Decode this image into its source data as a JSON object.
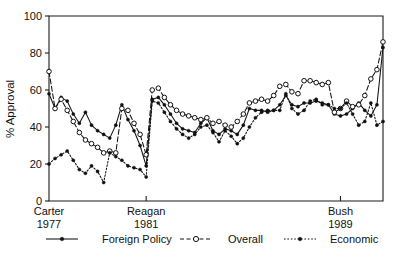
{
  "chart_data": {
    "type": "line",
    "title": "",
    "xlabel": "",
    "ylabel": "% Approval",
    "ylim": [
      0,
      100
    ],
    "yticks": [
      0,
      20,
      40,
      60,
      80,
      100
    ],
    "grid": false,
    "legend_position": "below",
    "xaxis_era_ticks": [
      {
        "label": "Carter",
        "year": "1977",
        "x_index": 0
      },
      {
        "label": "Reagan",
        "year": "1981",
        "x_index": 16
      },
      {
        "label": "Bush",
        "year": "1989",
        "x_index": 48
      }
    ],
    "x": [
      0,
      1,
      2,
      3,
      4,
      5,
      6,
      7,
      8,
      9,
      10,
      11,
      12,
      13,
      14,
      15,
      16,
      17,
      18,
      19,
      20,
      21,
      22,
      23,
      24,
      25,
      26,
      27,
      28,
      29,
      30,
      31,
      32,
      33,
      34,
      35,
      36,
      37,
      38,
      39,
      40,
      41,
      42,
      43,
      44,
      45,
      46,
      47,
      48,
      49,
      50,
      51,
      52,
      53,
      54,
      55
    ],
    "series": [
      {
        "name": "Foreign Policy",
        "marker": "filled-circle",
        "line": "solid",
        "values": [
          58,
          50,
          56,
          54,
          47,
          42,
          48,
          41,
          38,
          36,
          34,
          41,
          52,
          44,
          38,
          30,
          19,
          55,
          56,
          52,
          47,
          42,
          39,
          38,
          37,
          42,
          45,
          38,
          36,
          39,
          38,
          36,
          41,
          50,
          49,
          49,
          48,
          49,
          52,
          57,
          52,
          51,
          53,
          53,
          54,
          53,
          52,
          47,
          46,
          47,
          50,
          53,
          49,
          46,
          52,
          83
        ]
      },
      {
        "name": "Overall",
        "marker": "open-circle",
        "line": "dashed",
        "values": [
          70,
          50,
          55,
          49,
          43,
          37,
          33,
          31,
          29,
          26,
          27,
          26,
          50,
          49,
          42,
          36,
          25,
          60,
          61,
          56,
          52,
          49,
          47,
          46,
          45,
          44,
          45,
          42,
          43,
          41,
          40,
          43,
          47,
          53,
          54,
          55,
          54,
          57,
          62,
          63,
          59,
          58,
          65,
          65,
          64,
          63,
          64,
          48,
          50,
          54,
          51,
          52,
          57,
          66,
          71,
          86
        ]
      },
      {
        "name": "Economic",
        "marker": "filled-circle",
        "line": "dotted",
        "values": [
          20,
          23,
          25,
          27,
          22,
          17,
          15,
          19,
          16,
          10,
          26,
          24,
          22,
          19,
          18,
          17,
          13,
          54,
          53,
          48,
          43,
          39,
          36,
          34,
          36,
          40,
          41,
          37,
          32,
          38,
          35,
          31,
          34,
          40,
          45,
          48,
          49,
          49,
          49,
          58,
          50,
          47,
          49,
          54,
          55,
          52,
          52,
          50,
          50,
          53,
          47,
          41,
          43,
          53,
          41,
          43
        ]
      }
    ]
  },
  "axis": {
    "y_tick_labels": [
      "0",
      "20",
      "40",
      "60",
      "80",
      "100"
    ],
    "y_title": "% Approval"
  },
  "legend": {
    "items": [
      {
        "label": "Foreign Policy",
        "style": "solid-filled"
      },
      {
        "label": "Overall",
        "style": "dashed-open"
      },
      {
        "label": "Economic",
        "style": "dotted-filled"
      }
    ]
  }
}
